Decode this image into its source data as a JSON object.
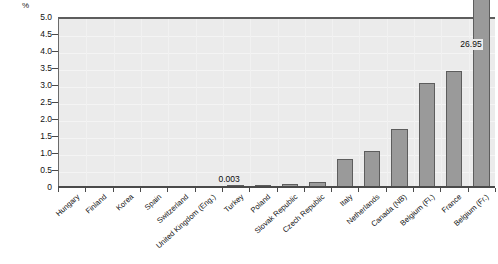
{
  "chart_data": {
    "type": "bar",
    "title": "",
    "subtitle": "",
    "xlabel": "",
    "ylabel": "%",
    "ylim": [
      0,
      5.0
    ],
    "y_ticks": [
      "0",
      "0.5",
      "1.0",
      "1.5",
      "2.0",
      "2.5",
      "3.0",
      "3.5",
      "4.0",
      "4.5",
      "5.0"
    ],
    "y_tick_values": [
      0,
      0.5,
      1.0,
      1.5,
      2.0,
      2.5,
      3.0,
      3.5,
      4.0,
      4.5,
      5.0
    ],
    "grid": true,
    "legend": "none",
    "categories": [
      "Hungary",
      "Finland",
      "Korea",
      "Spain",
      "Switzerland",
      "United Kingdom (Eng.)",
      "Turkey",
      "Poland",
      "Slovak Republic",
      "Czech Republic",
      "Italy",
      "Netherlands",
      "Canada (NB)",
      "Belgium (Fl.)",
      "France",
      "Belgium (Fr.)"
    ],
    "values": [
      0,
      0,
      0,
      0,
      0,
      0,
      0.003,
      0.02,
      0.08,
      0.14,
      0.82,
      1.05,
      1.72,
      3.06,
      3.42,
      26.95
    ],
    "annotations": [
      {
        "category": "Turkey",
        "text": "0.003"
      },
      {
        "category": "Belgium (Fr.)",
        "text": "26.95"
      }
    ],
    "clipped_bar": {
      "category": "Belgium (Fr.)",
      "value": 26.95,
      "note": "bar exceeds axis maximum and is drawn beyond the plot top"
    },
    "colors": {
      "bar_fill": "#9a9a9a",
      "bar_border": "#5d5d5d",
      "plot_background": "#ebebeb",
      "axis": "#4a4a4a",
      "text": "#111111"
    }
  }
}
